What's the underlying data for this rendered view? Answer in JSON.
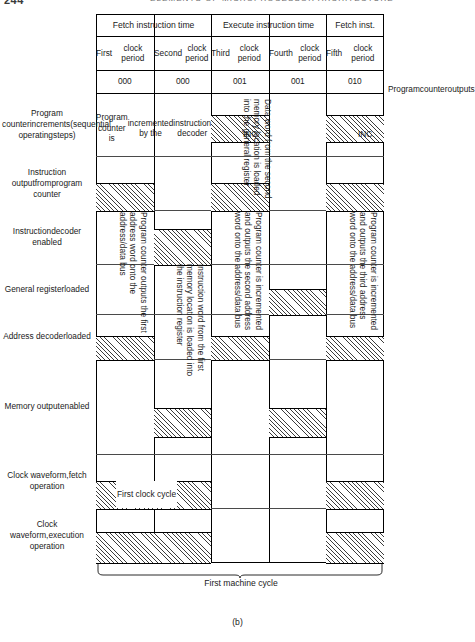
{
  "page": {
    "number": "244",
    "running_head": "ELEMENTS OF MICROPROCESSOR ARCHITECTURE",
    "figure_label": "(b)"
  },
  "diagram": {
    "title_groups": [
      {
        "label": "Fetch instruction time",
        "span": 2
      },
      {
        "label": "Execute instruction time",
        "span": 2
      },
      {
        "label": "Fetch inst.",
        "span": 1
      }
    ],
    "clock_periods": [
      "First\nclock period",
      "Second\nclock period",
      "Third\nclock period",
      "Fourth\nclock period",
      "Fifth\nclock period"
    ],
    "counter_values": [
      "000",
      "000",
      "001",
      "001",
      "010"
    ],
    "right_label": "Program\ncounter\noutputs",
    "rows": [
      {
        "name": "pc-increments",
        "label": "Program counter\nincrements\n(sequential operating\nsteps)"
      },
      {
        "name": "instruction-output",
        "label": "Instruction output\nfrom\nprogram counter"
      },
      {
        "name": "instruction-decoder-enabled",
        "label": "Instruction\ndecoder enabled"
      },
      {
        "name": "general-register-loaded",
        "label": "General register\nloaded"
      },
      {
        "name": "address-decoder-loaded",
        "label": "Address decoder\nloaded"
      },
      {
        "name": "memory-output-enabled",
        "label": "Memory output\nenabled"
      },
      {
        "name": "clock-fetch",
        "label": "Clock waveform,\nfetch operation"
      },
      {
        "name": "clock-execution",
        "label": "Clock waveform,\nexecution operation"
      }
    ],
    "annotations": {
      "pc_incremented_by_decoder": "Program counter is\nincremented by the\ninstruction decoder",
      "inc_third": "INC.",
      "inc_fifth": "INC.",
      "data_word_second": "Data word from the second\nmemory location is loaded\ninto the general register",
      "pc_outputs_first": "Program counter outputs the first\naddress word onto the\naddress/data bus",
      "instruction_word_first": "Instruction word from the first\nmemory location is loaded into\nthe instruction register",
      "pc_increment_second": "Program counter is incremented\nand outputs the second address\nword onto the address/data bus",
      "pc_increment_third": "Program counter is incremented\nand outputs the third address\nword onto the address/data bus",
      "first_clock_cycle": "First clock cycle"
    },
    "brace_caption": "First machine cycle"
  },
  "chart_data": {
    "type": "timing-diagram",
    "columns": [
      "First clock period",
      "Second clock period",
      "Third clock period",
      "Fourth clock period",
      "Fifth clock period"
    ],
    "column_groups": [
      "Fetch instruction time",
      "Fetch instruction time",
      "Execute instruction time",
      "Execute instruction time",
      "Fetch inst."
    ],
    "program_counter_outputs": [
      "000",
      "000",
      "001",
      "001",
      "010"
    ],
    "signals": [
      {
        "name": "Program counter increments (sequential operating steps)",
        "active": [
          false,
          false,
          true,
          false,
          true
        ]
      },
      {
        "name": "Instruction output from program counter",
        "active": [
          true,
          false,
          true,
          false,
          true
        ]
      },
      {
        "name": "Instruction decoder enabled",
        "active": [
          false,
          true,
          false,
          false,
          false
        ]
      },
      {
        "name": "General register loaded",
        "active": [
          false,
          false,
          false,
          true,
          false
        ]
      },
      {
        "name": "Address decoder loaded",
        "active": [
          true,
          false,
          true,
          false,
          true
        ]
      },
      {
        "name": "Memory output enabled",
        "active": [
          false,
          true,
          false,
          true,
          false
        ]
      },
      {
        "name": "Clock waveform, fetch operation",
        "active": [
          true,
          true,
          false,
          false,
          true
        ]
      },
      {
        "name": "Clock waveform, execution operation",
        "active": [
          true,
          true,
          false,
          false,
          true
        ]
      }
    ]
  }
}
